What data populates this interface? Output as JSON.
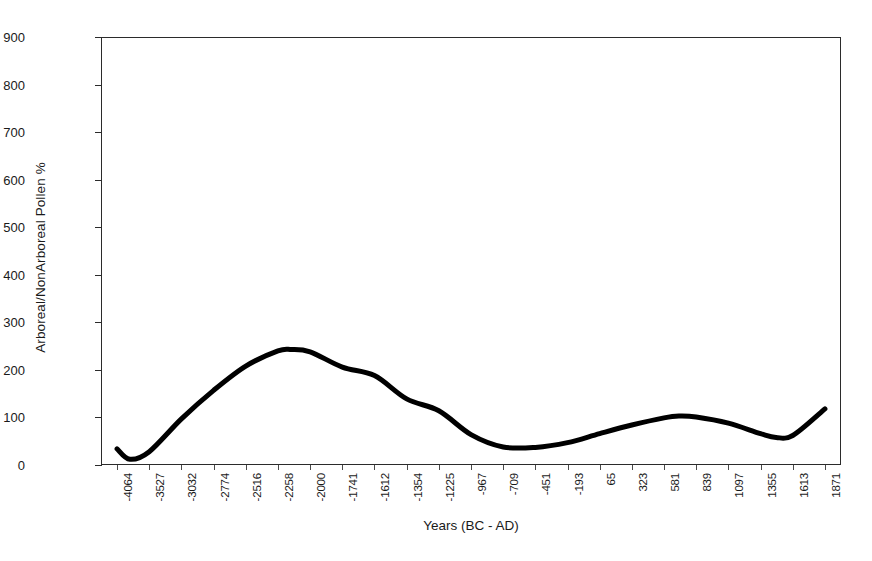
{
  "chart_data": {
    "type": "line",
    "title": "",
    "xlabel": "Years (BC - AD)",
    "ylabel": "Arboreal/NonArboreal Pollen %",
    "grid": false,
    "legend": null,
    "ylim": [
      0,
      900
    ],
    "yticks": [
      0,
      100,
      200,
      300,
      400,
      500,
      600,
      700,
      800,
      900
    ],
    "categories": [
      "-4064",
      "-3527",
      "-3032",
      "-2774",
      "-2516",
      "-2258",
      "-2000",
      "-1741",
      "-1612",
      "-1354",
      "-1225",
      "-967",
      "-709",
      "-451",
      "-193",
      "65",
      "323",
      "581",
      "839",
      "1097",
      "1355",
      "1613",
      "1871"
    ],
    "xtick_labels": [
      "-4064",
      "-3527",
      "-3032",
      "-2774",
      "-2516",
      "-2258",
      "-2000",
      "-1741",
      "-1612",
      "-1354",
      "-1225",
      "-967",
      "-709",
      "-451",
      "-193",
      "65",
      "323",
      "581",
      "839",
      "1097",
      "1355",
      "1613",
      "1871"
    ],
    "series": [
      {
        "name": "Arboreal/NonArboreal Pollen %",
        "color": "#000000",
        "line_width": 5,
        "x": [
          "-4064",
          "-3850",
          "-3527",
          "-3032",
          "-2774",
          "-2516",
          "-2258",
          "-2150",
          "-2000",
          "-1741",
          "-1612",
          "-1354",
          "-1225",
          "-967",
          "-709",
          "-451",
          "-193",
          "65",
          "323",
          "581",
          "700",
          "839",
          "1097",
          "1355",
          "1480",
          "1613",
          "1871"
        ],
        "values": [
          34,
          12,
          28,
          97,
          157,
          208,
          240,
          243,
          238,
          206,
          188,
          139,
          114,
          64,
          38,
          37,
          47,
          66,
          84,
          99,
          103,
          101,
          88,
          66,
          58,
          62,
          118
        ]
      }
    ]
  },
  "axes": {
    "y_title": "Arboreal/NonArboreal Pollen %",
    "x_title": "Years (BC - AD)",
    "y_tick_labels": [
      "900",
      "800",
      "700",
      "600",
      "500",
      "400",
      "300",
      "200",
      "100",
      "0"
    ],
    "x_tick_labels": [
      "-4064",
      "-3527",
      "-3032",
      "-2774",
      "-2516",
      "-2258",
      "-2000",
      "-1741",
      "-1612",
      "-1354",
      "-1225",
      "-967",
      "-709",
      "-451",
      "-193",
      "65",
      "323",
      "581",
      "839",
      "1097",
      "1355",
      "1613",
      "1871"
    ]
  },
  "colors": {
    "line": "#000000",
    "axis": "#2b2b2b",
    "text": "#1a1a1a",
    "background": "#ffffff"
  }
}
